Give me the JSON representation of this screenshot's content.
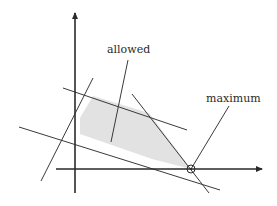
{
  "diagram": {
    "type": "linear-programming-feasible-region",
    "labels": {
      "allowed": "allowed",
      "maximum": "maximum"
    },
    "colors": {
      "line": "#3a3a3a",
      "axis": "#2a2a2a",
      "region_fill": "#e2e2e2",
      "background": "#ffffff"
    },
    "axes": {
      "x_axis": {
        "from": [
          56,
          169
        ],
        "to": [
          262,
          169
        ]
      },
      "y_axis": {
        "from": [
          75,
          193
        ],
        "to": [
          75,
          13
        ]
      }
    },
    "feasible_region": [
      [
        80,
        118
      ],
      [
        93,
        96
      ],
      [
        149,
        113
      ],
      [
        191,
        169
      ],
      [
        152,
        159
      ],
      [
        80,
        134
      ]
    ],
    "constraint_lines": [
      {
        "name": "upper-boundary",
        "from": [
          63,
          88
        ],
        "to": [
          187,
          130
        ]
      },
      {
        "name": "lower-boundary",
        "from": [
          19,
          127
        ],
        "to": [
          220,
          190
        ]
      },
      {
        "name": "left-slanted",
        "from": [
          41,
          181
        ],
        "to": [
          93,
          78
        ]
      },
      {
        "name": "right-steep",
        "from": [
          132,
          94
        ],
        "to": [
          209,
          193
        ]
      },
      {
        "name": "objective",
        "from": [
          191,
          169
        ],
        "to": [
          229,
          106
        ]
      }
    ],
    "pointer_lines": [
      {
        "name": "allowed-pointer",
        "from": [
          128,
          60
        ],
        "to": [
          111,
          142
        ]
      }
    ],
    "maximum_point": {
      "x": 191,
      "y": 169,
      "r": 4
    }
  }
}
